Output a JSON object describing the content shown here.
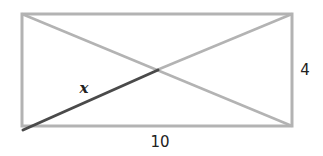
{
  "diagram": {
    "labels": {
      "width": "10",
      "height": "4",
      "half_diagonal": "x"
    },
    "colors": {
      "rectangle": "#b3b3b3",
      "diagonal": "#b3b3b3",
      "highlight": "#4a4a4a",
      "text": "#222222"
    }
  }
}
